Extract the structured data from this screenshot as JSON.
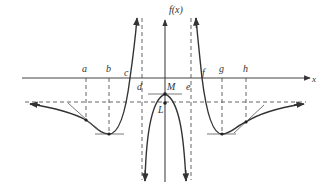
{
  "figure": {
    "type": "function-graph",
    "y_axis_label": "f(x)",
    "x_axis_label": "x",
    "point_labels": {
      "a": "a",
      "b": "b",
      "c": "c",
      "d": "d",
      "e": "e",
      "f": "f",
      "g": "g",
      "h": "h",
      "M": "M",
      "L": "L"
    },
    "features": {
      "vertical_asymptotes": [
        "x = d",
        "x = e"
      ],
      "horizontal_asymptote": "y = L",
      "local_maximum": "M",
      "local_minima": [
        "b",
        "g"
      ],
      "inflection_points": [
        "a",
        "h"
      ],
      "x_intercepts": [
        "c",
        "f"
      ]
    },
    "colors": {
      "line": "#333333",
      "background": "#ffffff"
    }
  }
}
